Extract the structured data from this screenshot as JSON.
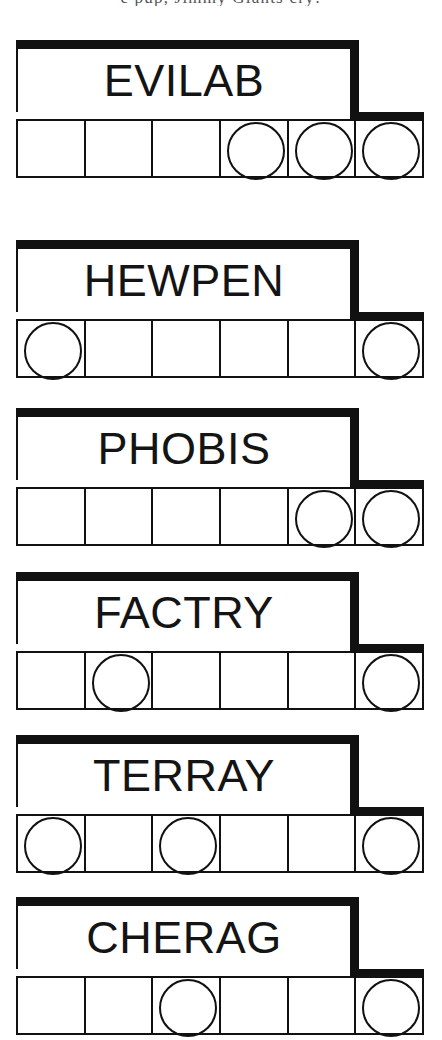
{
  "page": {
    "background_color": "#ffffff",
    "ink_color": "#111111",
    "top_cut_text": "e pup, Jimmy Giants cry!"
  },
  "legend": {
    "cell_count_per_row": 6,
    "marker_shape": "circle-outline",
    "marker_icon_name": "circle-marker-icon"
  },
  "blocks": [
    {
      "id": "evilab",
      "title": "EVILAB",
      "top": 40,
      "cells": [
        {
          "index": 1,
          "marked": false
        },
        {
          "index": 2,
          "marked": false
        },
        {
          "index": 3,
          "marked": false
        },
        {
          "index": 4,
          "marked": true
        },
        {
          "index": 5,
          "marked": true
        },
        {
          "index": 6,
          "marked": true
        }
      ],
      "marked_cells": [
        4,
        5,
        6
      ],
      "marked_count": 3
    },
    {
      "id": "hewpen",
      "title": "HEWPEN",
      "top": 240,
      "cells": [
        {
          "index": 1,
          "marked": true
        },
        {
          "index": 2,
          "marked": false
        },
        {
          "index": 3,
          "marked": false
        },
        {
          "index": 4,
          "marked": false
        },
        {
          "index": 5,
          "marked": false
        },
        {
          "index": 6,
          "marked": true
        }
      ],
      "marked_cells": [
        1,
        6
      ],
      "marked_count": 2
    },
    {
      "id": "phobis",
      "title": "PHOBIS",
      "top": 408,
      "cells": [
        {
          "index": 1,
          "marked": false
        },
        {
          "index": 2,
          "marked": false
        },
        {
          "index": 3,
          "marked": false
        },
        {
          "index": 4,
          "marked": false
        },
        {
          "index": 5,
          "marked": true
        },
        {
          "index": 6,
          "marked": true
        }
      ],
      "marked_cells": [
        5,
        6
      ],
      "marked_count": 2
    },
    {
      "id": "factry",
      "title": "FACTRY",
      "top": 572,
      "cells": [
        {
          "index": 1,
          "marked": false
        },
        {
          "index": 2,
          "marked": true
        },
        {
          "index": 3,
          "marked": false
        },
        {
          "index": 4,
          "marked": false
        },
        {
          "index": 5,
          "marked": false
        },
        {
          "index": 6,
          "marked": true
        }
      ],
      "marked_cells": [
        2,
        6
      ],
      "marked_count": 2
    },
    {
      "id": "terray",
      "title": "TERRAY",
      "top": 735,
      "cells": [
        {
          "index": 1,
          "marked": true
        },
        {
          "index": 2,
          "marked": false
        },
        {
          "index": 3,
          "marked": true
        },
        {
          "index": 4,
          "marked": false
        },
        {
          "index": 5,
          "marked": false
        },
        {
          "index": 6,
          "marked": true
        }
      ],
      "marked_cells": [
        1,
        3,
        6
      ],
      "marked_count": 3
    },
    {
      "id": "cherag",
      "title": "CHERAG",
      "top": 897,
      "cells": [
        {
          "index": 1,
          "marked": false
        },
        {
          "index": 2,
          "marked": false
        },
        {
          "index": 3,
          "marked": true
        },
        {
          "index": 4,
          "marked": false
        },
        {
          "index": 5,
          "marked": false
        },
        {
          "index": 6,
          "marked": true
        }
      ],
      "marked_cells": [
        3,
        6
      ],
      "marked_count": 2
    }
  ]
}
